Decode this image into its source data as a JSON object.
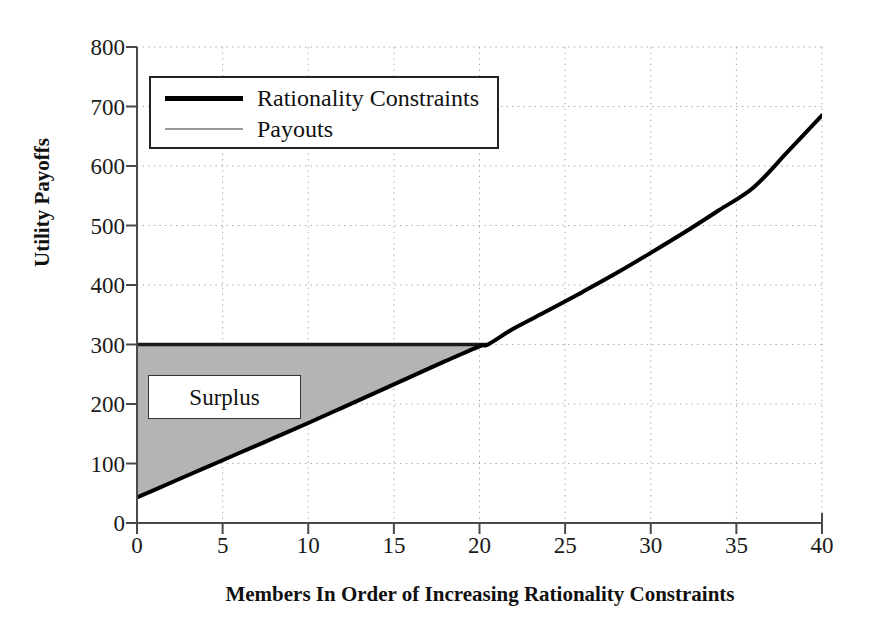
{
  "chart_data": {
    "type": "line",
    "title": "",
    "xlabel": "Members In Order of Increasing Rationality Constraints",
    "ylabel": "Utility Payoffs",
    "xlim": [
      0,
      40
    ],
    "ylim": [
      0,
      800
    ],
    "xticks": [
      0,
      5,
      10,
      15,
      20,
      25,
      30,
      35,
      40
    ],
    "yticks": [
      0,
      100,
      200,
      300,
      400,
      500,
      600,
      700,
      800
    ],
    "grid": true,
    "grid_style": "dotted",
    "legend_position": "upper left",
    "series": [
      {
        "name": "Rationality Constraints",
        "color": "#000000",
        "linewidth": 4,
        "x": [
          0,
          2,
          4,
          6,
          8,
          10,
          12,
          14,
          16,
          18,
          20,
          20.5,
          22,
          24,
          26,
          28,
          30,
          32,
          34,
          36,
          38,
          40
        ],
        "values": [
          43,
          68,
          93,
          118,
          143,
          168,
          194,
          220,
          246,
          272,
          297,
          300,
          327,
          357,
          388,
          420,
          454,
          489,
          526,
          564,
          624,
          685
        ]
      },
      {
        "name": "Payouts",
        "color": "#9a9a9a",
        "linewidth": 2,
        "x": [
          0,
          20.5
        ],
        "values": [
          300,
          300
        ]
      }
    ],
    "shaded_region": {
      "label": "Surplus",
      "color": "#b4b4b4",
      "upper_bound": "Payouts",
      "lower_bound": "Rationality Constraints",
      "x_range": [
        0,
        20.5
      ]
    },
    "annotations": [
      {
        "text": "Surplus",
        "x": 4.5,
        "y": 215
      }
    ]
  },
  "legend": {
    "entries": [
      {
        "label": "Rationality Constraints",
        "swatch": "thick-black-line"
      },
      {
        "label": "Payouts",
        "swatch": "thin-gray-line"
      }
    ]
  },
  "axes": {
    "x_tick_labels": [
      "0",
      "5",
      "10",
      "15",
      "20",
      "25",
      "30",
      "35",
      "40"
    ],
    "y_tick_labels": [
      "0",
      "100",
      "200",
      "300",
      "400",
      "500",
      "600",
      "700",
      "800"
    ],
    "x_axis_title": "Members In Order of Increasing Rationality Constraints",
    "y_axis_title": "Utility Payoffs"
  },
  "colors": {
    "line_primary": "#000000",
    "line_secondary": "#9a9a9a",
    "surplus_fill": "#b4b4b4",
    "grid": "#b0b0b0",
    "axis": "#444444",
    "background": "#ffffff"
  }
}
